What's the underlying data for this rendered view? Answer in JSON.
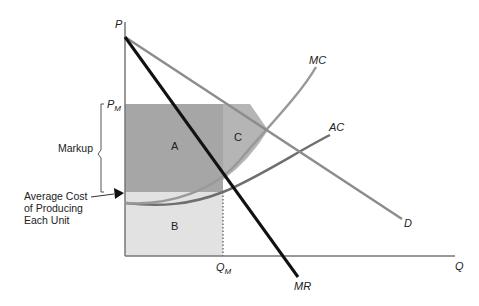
{
  "diagram": {
    "axes": {
      "y_label": "P",
      "x_label": "Q"
    },
    "price_label": {
      "main": "P",
      "sub": "M"
    },
    "quantity_label": {
      "main": "Q",
      "sub": "M"
    },
    "curves": {
      "demand": "D",
      "marginal_revenue": "MR",
      "marginal_cost": "MC",
      "average_cost": "AC"
    },
    "regions": {
      "a": "A",
      "b": "B",
      "c": "C"
    },
    "annotations": {
      "markup": "Markup",
      "avg_cost_line1": "Average Cost",
      "avg_cost_line2": "of Producing",
      "avg_cost_line3": "Each Unit"
    },
    "colors": {
      "region_a": "#a6a6a6",
      "region_b": "#e2e2e2",
      "region_c": "#b5b5b5",
      "demand": "#8c8c8c",
      "mr": "#111111",
      "mc": "#999999",
      "ac": "#6e6e6e",
      "axis": "#777777"
    }
  }
}
